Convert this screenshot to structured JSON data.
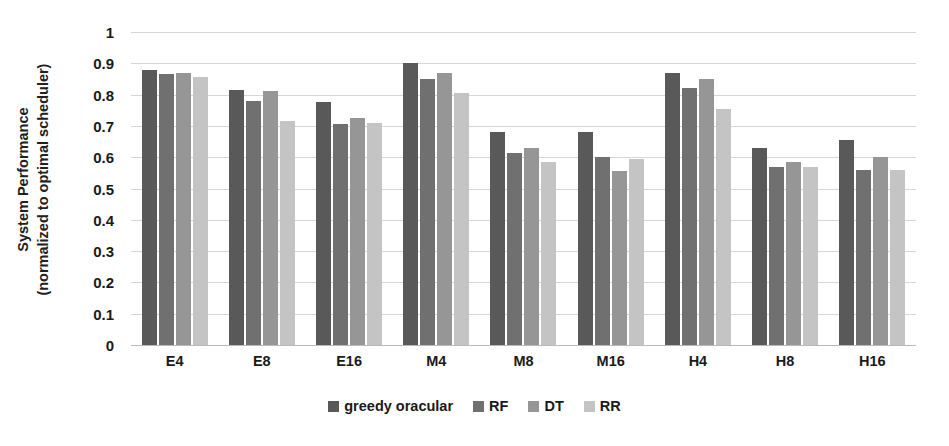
{
  "chart_data": {
    "type": "bar",
    "title": "",
    "xlabel": "",
    "ylabel": "System Performance (normalized to optimal scheduler)",
    "ylabel_line1": "System Performance",
    "ylabel_line2": "(normalized to optimal scheduler)",
    "ylim": [
      0,
      1
    ],
    "ytick_labels": [
      "1",
      "0.9",
      "0.8",
      "0.7",
      "0.6",
      "0.5",
      "0.4",
      "0.3",
      "0.2",
      "0.1",
      "0"
    ],
    "ytick_values": [
      1,
      0.9,
      0.8,
      0.7,
      0.6,
      0.5,
      0.4,
      0.3,
      0.2,
      0.1,
      0
    ],
    "grid": true,
    "grid_axis": "y",
    "legend_position": "bottom-center",
    "categories": [
      "E4",
      "E8",
      "E16",
      "M4",
      "M8",
      "M16",
      "H4",
      "H8",
      "H16"
    ],
    "series": [
      {
        "name": "greedy oracular",
        "color": "#595959",
        "values": [
          0.88,
          0.815,
          0.775,
          0.9,
          0.68,
          0.68,
          0.87,
          0.63,
          0.655
        ]
      },
      {
        "name": "RF",
        "color": "#707070",
        "values": [
          0.865,
          0.78,
          0.705,
          0.85,
          0.615,
          0.6,
          0.82,
          0.57,
          0.56
        ]
      },
      {
        "name": "DT",
        "color": "#969696",
        "values": [
          0.87,
          0.81,
          0.725,
          0.87,
          0.63,
          0.555,
          0.85,
          0.585,
          0.6
        ]
      },
      {
        "name": "RR",
        "color": "#c4c4c4",
        "values": [
          0.855,
          0.715,
          0.71,
          0.805,
          0.585,
          0.595,
          0.755,
          0.57,
          0.56
        ]
      }
    ]
  }
}
